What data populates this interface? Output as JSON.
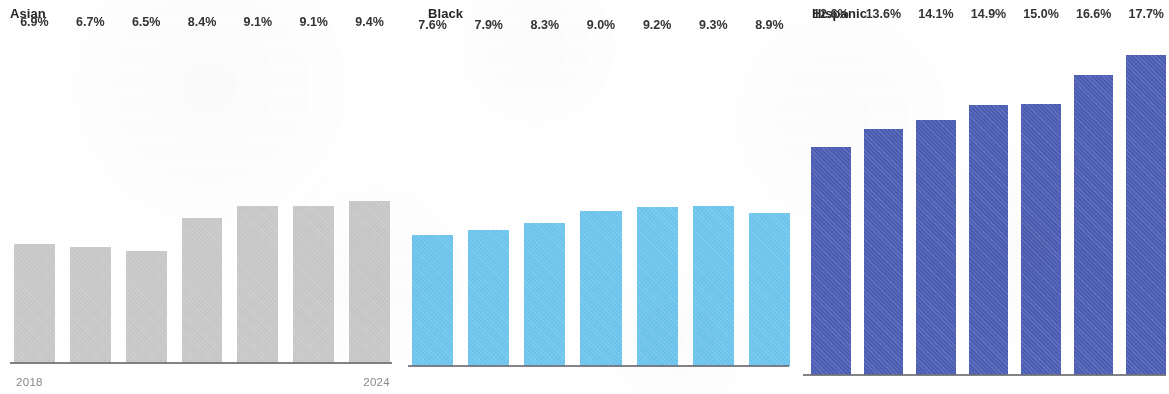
{
  "chart_data": {
    "type": "bar",
    "title": "",
    "xlabel": "",
    "ylabel": "",
    "grid": false,
    "legend": "none",
    "layout": "small multiples, 3 panels side by side, shared y-scale",
    "value_format": "percent, one decimal",
    "categories": [
      "2018",
      "2019",
      "2020",
      "2021",
      "2022",
      "2023",
      "2024"
    ],
    "axis_tick_labels_shown": [
      "2018",
      "2024"
    ],
    "ylim": [
      0,
      17.7
    ],
    "series": [
      {
        "name": "Asian",
        "color": "#c9c9c9",
        "values": [
          6.9,
          6.7,
          6.5,
          8.4,
          9.1,
          9.1,
          9.4
        ],
        "labels": [
          "6.9%",
          "6.7%",
          "6.5%",
          "8.4%",
          "9.1%",
          "9.1%",
          "9.4%"
        ]
      },
      {
        "name": "Black",
        "color": "#6ec6ef",
        "values": [
          7.6,
          7.9,
          8.3,
          9.0,
          9.2,
          9.3,
          8.9
        ],
        "labels": [
          "7.6%",
          "7.9%",
          "8.3%",
          "9.0%",
          "9.2%",
          "9.3%",
          "8.9%"
        ]
      },
      {
        "name": "Hispanic",
        "color": "#4d5fb5",
        "values": [
          12.6,
          13.6,
          14.1,
          14.9,
          15.0,
          16.6,
          17.7
        ],
        "labels": [
          "12.6%",
          "13.6%",
          "14.1%",
          "14.9%",
          "15.0%",
          "16.6%",
          "17.7%"
        ]
      }
    ]
  },
  "panels": [
    {
      "id": "asian",
      "title": "Asian",
      "color": "#c9c9c9",
      "show_ticks": true,
      "tick_start": "2018",
      "tick_end": "2024",
      "bars": [
        {
          "label": "6.9%",
          "value": 6.9,
          "category": "2018"
        },
        {
          "label": "6.7%",
          "value": 6.7,
          "category": "2019"
        },
        {
          "label": "6.5%",
          "value": 6.5,
          "category": "2020"
        },
        {
          "label": "8.4%",
          "value": 8.4,
          "category": "2021"
        },
        {
          "label": "9.1%",
          "value": 9.1,
          "category": "2022"
        },
        {
          "label": "9.1%",
          "value": 9.1,
          "category": "2023"
        },
        {
          "label": "9.4%",
          "value": 9.4,
          "category": "2024"
        }
      ]
    },
    {
      "id": "black",
      "title": "Black",
      "color": "#6ec6ef",
      "show_ticks": false,
      "tick_start": "",
      "tick_end": "",
      "bars": [
        {
          "label": "7.6%",
          "value": 7.6,
          "category": "2018"
        },
        {
          "label": "7.9%",
          "value": 7.9,
          "category": "2019"
        },
        {
          "label": "8.3%",
          "value": 8.3,
          "category": "2020"
        },
        {
          "label": "9.0%",
          "value": 9.0,
          "category": "2021"
        },
        {
          "label": "9.2%",
          "value": 9.2,
          "category": "2022"
        },
        {
          "label": "9.3%",
          "value": 9.3,
          "category": "2023"
        },
        {
          "label": "8.9%",
          "value": 8.9,
          "category": "2024"
        }
      ]
    },
    {
      "id": "hispanic",
      "title": "Hispanic",
      "color": "#4d5fb5",
      "show_ticks": false,
      "tick_start": "",
      "tick_end": "",
      "bars": [
        {
          "label": "12.6%",
          "value": 12.6,
          "category": "2018"
        },
        {
          "label": "13.6%",
          "value": 13.6,
          "category": "2019"
        },
        {
          "label": "14.1%",
          "value": 14.1,
          "category": "2020"
        },
        {
          "label": "14.9%",
          "value": 14.9,
          "category": "2021"
        },
        {
          "label": "15.0%",
          "value": 15.0,
          "category": "2022"
        },
        {
          "label": "16.6%",
          "value": 16.6,
          "category": "2023"
        },
        {
          "label": "17.7%",
          "value": 17.7,
          "category": "2024"
        }
      ]
    }
  ],
  "scale": {
    "max_value": 17.7
  }
}
